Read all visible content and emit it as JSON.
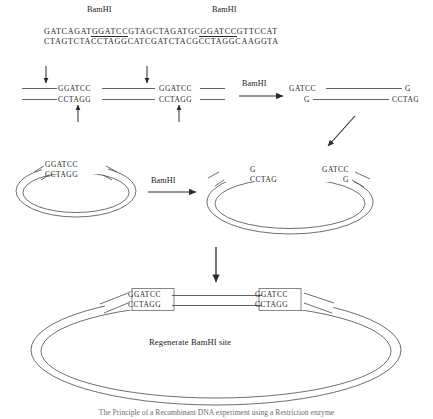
{
  "figure": {
    "title_enzyme": "BamHI",
    "caption": "The Principle of a Recombinant DNA experiment using a Restriction enzyme"
  },
  "top_sequence": {
    "enzyme_label_left": "BamHI",
    "enzyme_label_right": "BamHI",
    "top_strand": "GATCAGATGGATCCGTAGCTAGATGCGGATCCGTTCCAT",
    "bottom_strand": "CTAGTCTACCTAGGCATCGATCTACGCCTAGGCAAGGTA",
    "recognition_site_top": "GGATCC",
    "recognition_site_bottom": "CCTAGG",
    "top_strand_parts": {
      "pre1": "GATCAGAT",
      "site1": "GGATCC",
      "mid": "GTAGCTAGATGC",
      "site2": "GGATCC",
      "post": "GTTCCAT"
    },
    "bottom_strand_parts": {
      "pre1": "CTAGTCTA",
      "site1": "CCTAGG",
      "mid": "CATCGATCTACG",
      "site2": "CCTAGG",
      "post": "CAAGGTA"
    }
  },
  "cut_row": {
    "site_left_top": "GGATCC",
    "site_left_bottom": "CCTAGG",
    "site_right_top": "GGATCC",
    "site_right_bottom": "CCTAGG",
    "enzyme_label": "BamHI",
    "product_top_left": "GATCC",
    "product_top_right": "G",
    "product_bottom_left": "G",
    "product_bottom_right": "CCTAG"
  },
  "plasmid_uncut": {
    "top_strand": "GGATCC",
    "bottom_strand": "CCTAGG",
    "enzyme_label": "BamHI"
  },
  "plasmid_cut": {
    "left_top": "G",
    "left_bottom": "CCTAG",
    "right_top": "GATCC",
    "right_bottom": "G"
  },
  "ligated_plasmid": {
    "junction_left": {
      "top_first": "G",
      "top_rest": "GATCC",
      "bottom_first": "CCTAG",
      "bottom_rest": "G"
    },
    "junction_right": {
      "top_first": "G",
      "top_rest": "GATCC",
      "bottom_first": "CCTAG",
      "bottom_rest": "G"
    },
    "center_label": "Regenerate BamHI site"
  },
  "colors": {
    "ink": "#1a1a1a",
    "line": "#3a3a3a",
    "box": "#555555",
    "caption": "#6d6d6d"
  }
}
